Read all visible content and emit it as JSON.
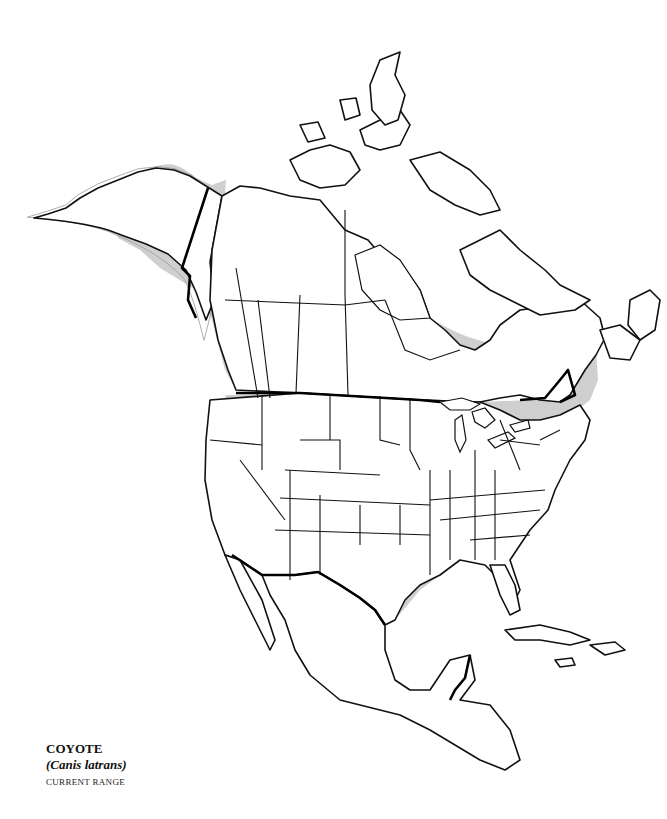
{
  "map": {
    "type": "species range map",
    "region": "North America",
    "range_fill_color": "#cfcfcf",
    "outline_color": "#111111",
    "background_color": "#ffffff"
  },
  "caption": {
    "common_name": "COYOTE",
    "scientific_name": "(Canis latrans)",
    "subtitle": "CURRENT RANGE"
  }
}
